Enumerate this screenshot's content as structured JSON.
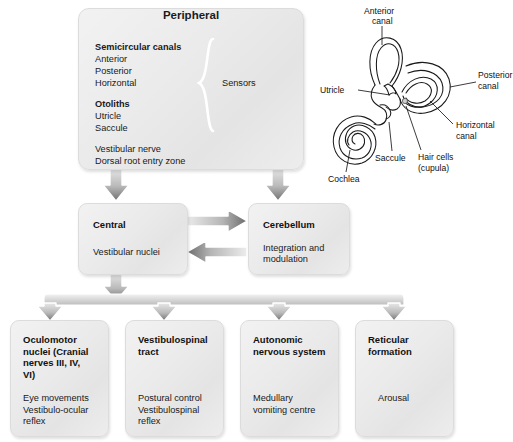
{
  "diagram": {
    "colors": {
      "box_fill": "#ececec",
      "box_border": "#dcdcdc",
      "arrow_dark": "#6e6e6e",
      "arrow_light": "#e9e9e9",
      "text": "#1a1a1a",
      "background": "#ffffff"
    }
  },
  "peripheral": {
    "title": "Peripheral",
    "group1_heading": "Semicircular canals",
    "group1_items": [
      "Anterior",
      "Posterior",
      "Horizontal"
    ],
    "group2_heading": "Otoliths",
    "group2_items": [
      "Utricle",
      "Saccule"
    ],
    "extra_items": [
      "Vestibular nerve",
      "Dorsal root entry zone"
    ],
    "brace_label": "Sensors"
  },
  "central": {
    "title": "Central",
    "body": "Vestibular nuclei"
  },
  "cerebellum": {
    "title": "Cerebellum",
    "body_line1": "Integration and",
    "body_line2": "modulation"
  },
  "outputs": [
    {
      "title_lines": [
        "Oculomotor",
        "nuclei (Cranial",
        "nerves III, IV,",
        "VI)"
      ],
      "body_lines": [
        "Eye movements",
        "Vestibulo-ocular",
        "reflex"
      ]
    },
    {
      "title_lines": [
        "Vestibulospinal",
        "tract"
      ],
      "body_lines": [
        "Postural control",
        "Vestibulospinal",
        "reflex"
      ]
    },
    {
      "title_lines": [
        "Autonomic",
        "nervous system"
      ],
      "body_lines": [
        "Medullary",
        "vomiting centre"
      ]
    },
    {
      "title_lines": [
        "Reticular",
        "formation"
      ],
      "body_lines": [
        "Arousal"
      ]
    }
  ],
  "anatomy": {
    "caption": "Membranous labyrinth",
    "labels": {
      "anterior_canal_l1": "Anterior",
      "anterior_canal_l2": "canal",
      "posterior_canal_l1": "Posterior",
      "posterior_canal_l2": "canal",
      "horizontal_canal_l1": "Horizontal",
      "horizontal_canal_l2": "canal",
      "utricle": "Utricle",
      "saccule": "Saccule",
      "cochlea": "Cochlea",
      "hair_cells_l1": "Hair cells",
      "hair_cells_l2": "(cupula)"
    }
  }
}
